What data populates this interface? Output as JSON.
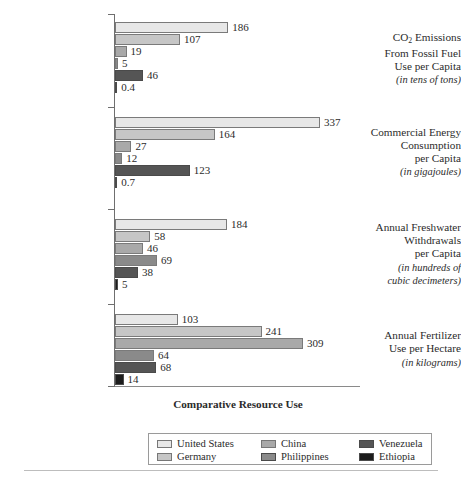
{
  "chart_data": {
    "type": "bar",
    "orientation": "horizontal",
    "title": "",
    "xlabel": "Comparative Resource Use",
    "ylabel": "",
    "grid": false,
    "legend_position": "bottom",
    "xlim": [
      0,
      337
    ],
    "categories": [
      "CO2 Emissions From Fossil Fuel Use per Capita (in tens of tons)",
      "Commercial Energy Consumption per Capita (in gigajoules)",
      "Annual Freshwater Withdrawals per Capita (in hundreds of cubic decimeters)",
      "Annual Fertilizer Use per Hectare (in kilograms)"
    ],
    "series": [
      {
        "name": "United States",
        "color": "#e7e7e7",
        "values": [
          186,
          337,
          184,
          103
        ]
      },
      {
        "name": "Germany",
        "color": "#c6c6c6",
        "values": [
          107,
          164,
          58,
          241
        ]
      },
      {
        "name": "China",
        "color": "#a9a9a9",
        "values": [
          19,
          27,
          46,
          309
        ]
      },
      {
        "name": "Philippines",
        "color": "#8a8a8a",
        "values": [
          5,
          12,
          69,
          64
        ]
      },
      {
        "name": "Venezuela",
        "color": "#555555",
        "values": [
          46,
          123,
          38,
          68
        ]
      },
      {
        "name": "Ethiopia",
        "color": "#1c1c1c",
        "values": [
          0.4,
          0.7,
          5,
          14
        ]
      }
    ]
  },
  "axis_title": "Comparative Resource Use",
  "groups": [
    {
      "name": "co2-emissions",
      "label_lines": [
        "CO2 Emissions",
        "From Fossil Fuel",
        "Use per Capita"
      ],
      "unit_lines": [
        "(in tens of tons)"
      ],
      "values": [
        "186",
        "107",
        "19",
        "5",
        "46",
        "0.4"
      ]
    },
    {
      "name": "commercial-energy",
      "label_lines": [
        "Commercial Energy",
        "Consumption",
        "per Capita"
      ],
      "unit_lines": [
        "(in gigajoules)"
      ],
      "values": [
        "337",
        "164",
        "27",
        "12",
        "123",
        "0.7"
      ]
    },
    {
      "name": "freshwater-withdrawals",
      "label_lines": [
        "Annual Freshwater",
        "Withdrawals",
        "per Capita"
      ],
      "unit_lines": [
        "(in hundreds of",
        "cubic decimeters)"
      ],
      "values": [
        "184",
        "58",
        "46",
        "69",
        "38",
        "5"
      ]
    },
    {
      "name": "fertilizer-use",
      "label_lines": [
        "Annual Fertilizer",
        "Use per Hectare"
      ],
      "unit_lines": [
        "(in kilograms)"
      ],
      "values": [
        "103",
        "241",
        "309",
        "64",
        "68",
        "14"
      ]
    }
  ],
  "legend": {
    "entries": [
      {
        "label": "United States",
        "color": "#e7e7e7"
      },
      {
        "label": "China",
        "color": "#a9a9a9"
      },
      {
        "label": "Venezuela",
        "color": "#555555"
      },
      {
        "label": "Germany",
        "color": "#c6c6c6"
      },
      {
        "label": "Philippines",
        "color": "#8a8a8a"
      },
      {
        "label": "Ethiopia",
        "color": "#1c1c1c"
      }
    ]
  }
}
